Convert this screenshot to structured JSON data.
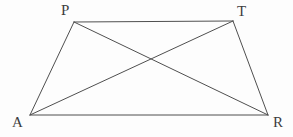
{
  "figure": {
    "name": "Trapezoid PART with diagonals",
    "background_color": "#fdfdfd",
    "stroke_color": "#4f4f4f",
    "label_color": "#3d3d3d",
    "stroke_width": 1,
    "width": 293,
    "height": 137
  },
  "vertices": [
    {
      "id": "P",
      "label": "P",
      "x": 74,
      "y": 22,
      "label_x": 61,
      "label_y": 3
    },
    {
      "id": "T",
      "label": "T",
      "x": 233,
      "y": 21,
      "label_x": 237,
      "label_y": 4
    },
    {
      "id": "R",
      "label": "R",
      "x": 268,
      "y": 115,
      "label_x": 273,
      "label_y": 115
    },
    {
      "id": "A",
      "label": "A",
      "x": 30,
      "y": 115,
      "label_x": 12,
      "label_y": 115
    }
  ],
  "segments": [
    {
      "id": "PT",
      "name": "side-p-t",
      "from": "P",
      "to": "T",
      "kind": "side",
      "x1": 74,
      "y1": 22,
      "x2": 233,
      "y2": 21
    },
    {
      "id": "TR",
      "name": "side-t-r",
      "from": "T",
      "to": "R",
      "kind": "side",
      "x1": 233,
      "y1": 21,
      "x2": 268,
      "y2": 115
    },
    {
      "id": "AR",
      "name": "side-a-r",
      "from": "A",
      "to": "R",
      "kind": "side",
      "x1": 30,
      "y1": 115,
      "x2": 268,
      "y2": 115
    },
    {
      "id": "AP",
      "name": "side-a-p",
      "from": "A",
      "to": "P",
      "kind": "side",
      "x1": 30,
      "y1": 115,
      "x2": 74,
      "y2": 22
    },
    {
      "id": "PR",
      "name": "diagonal-p-r",
      "from": "P",
      "to": "R",
      "kind": "diagonal",
      "x1": 74,
      "y1": 22,
      "x2": 268,
      "y2": 115
    },
    {
      "id": "AT",
      "name": "diagonal-a-t",
      "from": "A",
      "to": "T",
      "kind": "diagonal",
      "x1": 30,
      "y1": 115,
      "x2": 233,
      "y2": 21
    }
  ],
  "intersection": {
    "name": "diagonal-intersection",
    "x": 152,
    "y": 60
  }
}
